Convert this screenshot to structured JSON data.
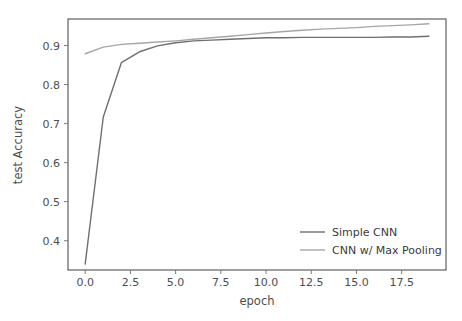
{
  "figure": {
    "background_color": "#ffffff",
    "frame_color": "#3f3f3f"
  },
  "chart_data": {
    "type": "line",
    "title": "",
    "xlabel": "epoch",
    "ylabel": "test Accuracy",
    "xlim": [
      -0.95,
      19.95
    ],
    "ylim": [
      0.325,
      0.968
    ],
    "xticks": [
      0.0,
      2.5,
      5.0,
      7.5,
      10.0,
      12.5,
      15.0,
      17.5
    ],
    "xticklabels": [
      "0.0",
      "2.5",
      "5.0",
      "7.5",
      "10.0",
      "12.5",
      "15.0",
      "17.5"
    ],
    "yticks": [
      0.4,
      0.5,
      0.6,
      0.7,
      0.8,
      0.9
    ],
    "yticklabels": [
      "0.4",
      "0.5",
      "0.6",
      "0.7",
      "0.8",
      "0.9"
    ],
    "grid": false,
    "legend_position": "lower right",
    "x": [
      0,
      1,
      2,
      3,
      4,
      5,
      6,
      7,
      8,
      9,
      10,
      11,
      12,
      13,
      14,
      15,
      16,
      17,
      18,
      19
    ],
    "series": [
      {
        "name": "Simple CNN",
        "color": "#6f6f6f",
        "linewidth": 1.4,
        "values": [
          0.34,
          0.717,
          0.856,
          0.884,
          0.899,
          0.907,
          0.912,
          0.914,
          0.916,
          0.918,
          0.92,
          0.92,
          0.921,
          0.921,
          0.921,
          0.921,
          0.921,
          0.922,
          0.922,
          0.924
        ]
      },
      {
        "name": "CNN w/ Max Pooling",
        "color": "#a6a6a6",
        "linewidth": 1.4,
        "values": [
          0.879,
          0.896,
          0.903,
          0.906,
          0.909,
          0.912,
          0.916,
          0.92,
          0.924,
          0.928,
          0.932,
          0.936,
          0.939,
          0.942,
          0.944,
          0.946,
          0.949,
          0.951,
          0.953,
          0.956
        ]
      }
    ],
    "legend": [
      {
        "label": "Simple CNN",
        "color": "#6f6f6f"
      },
      {
        "label": "CNN w/ Max Pooling",
        "color": "#a6a6a6"
      }
    ]
  }
}
